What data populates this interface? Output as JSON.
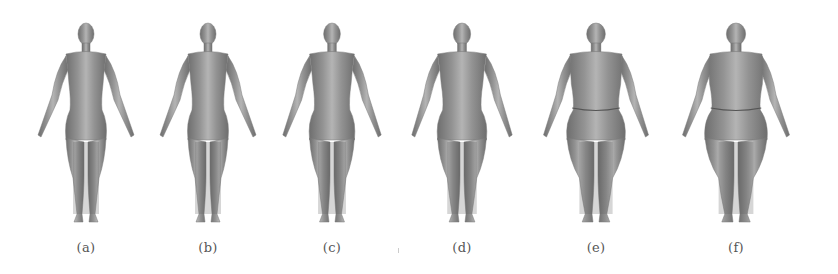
{
  "figure": {
    "panels": [
      {
        "label": "(a)",
        "center_x": 86,
        "width_scale": 1.0
      },
      {
        "label": "(b)",
        "center_x": 208,
        "width_scale": 1.0
      },
      {
        "label": "(c)",
        "center_x": 332,
        "width_scale": 1.12
      },
      {
        "label": "(d)",
        "center_x": 462,
        "width_scale": 1.22
      },
      {
        "label": "(e)",
        "center_x": 596,
        "width_scale": 1.45
      },
      {
        "label": "(f)",
        "center_x": 736,
        "width_scale": 1.55
      }
    ],
    "colors": {
      "skin_light": "#b4b4b4",
      "skin_mid": "#939393",
      "skin_dark": "#6e6e6e",
      "caption": "#555555"
    }
  }
}
